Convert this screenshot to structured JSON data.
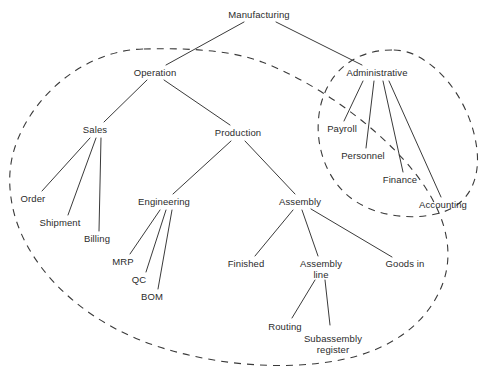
{
  "diagram": {
    "type": "tree-with-dashed-groupings",
    "colors": {
      "text": "#2b2b2b",
      "edge": "#3a3a3a",
      "boundary": "#3a3a3a",
      "background": "#ffffff"
    },
    "nodes": [
      {
        "id": "manufacturing",
        "label": "Manufacturing",
        "x": 259,
        "y": 15
      },
      {
        "id": "operation",
        "label": "Operation",
        "x": 155,
        "y": 73
      },
      {
        "id": "administrative",
        "label": "Administrative",
        "x": 377,
        "y": 73
      },
      {
        "id": "sales",
        "label": "Sales",
        "x": 95,
        "y": 130
      },
      {
        "id": "production",
        "label": "Production",
        "x": 238,
        "y": 133
      },
      {
        "id": "payroll",
        "label": "Payroll",
        "x": 342,
        "y": 129
      },
      {
        "id": "personnel",
        "label": "Personnel",
        "x": 363,
        "y": 156
      },
      {
        "id": "finance",
        "label": "Finance",
        "x": 400,
        "y": 180
      },
      {
        "id": "accounting",
        "label": "Accounting",
        "x": 443,
        "y": 205
      },
      {
        "id": "order",
        "label": "Order",
        "x": 33,
        "y": 199
      },
      {
        "id": "shipment",
        "label": "Shipment",
        "x": 60,
        "y": 223
      },
      {
        "id": "billing",
        "label": "Billing",
        "x": 97,
        "y": 239
      },
      {
        "id": "engineering",
        "label": "Engineering",
        "x": 164,
        "y": 202
      },
      {
        "id": "assembly",
        "label": "Assembly",
        "x": 300,
        "y": 202
      },
      {
        "id": "mrp",
        "label": "MRP",
        "x": 123,
        "y": 262
      },
      {
        "id": "qc",
        "label": "QC",
        "x": 139,
        "y": 280
      },
      {
        "id": "bom",
        "label": "BOM",
        "x": 152,
        "y": 297
      },
      {
        "id": "finished",
        "label": "Finished",
        "x": 246,
        "y": 264
      },
      {
        "id": "assembly_line",
        "label": "Assembly\nline",
        "x": 321,
        "y": 264
      },
      {
        "id": "goods_in",
        "label": "Goods in",
        "x": 405,
        "y": 264
      },
      {
        "id": "routing",
        "label": "Routing",
        "x": 285,
        "y": 327
      },
      {
        "id": "subassembly_register",
        "label": "Subassembly\nregister",
        "x": 333,
        "y": 339
      }
    ],
    "edges": [
      {
        "from": "manufacturing",
        "to": "operation"
      },
      {
        "from": "manufacturing",
        "to": "administrative"
      },
      {
        "from": "operation",
        "to": "sales"
      },
      {
        "from": "operation",
        "to": "production"
      },
      {
        "from": "administrative",
        "to": "payroll"
      },
      {
        "from": "administrative",
        "to": "personnel"
      },
      {
        "from": "administrative",
        "to": "finance"
      },
      {
        "from": "administrative",
        "to": "accounting"
      },
      {
        "from": "sales",
        "to": "order"
      },
      {
        "from": "sales",
        "to": "shipment"
      },
      {
        "from": "sales",
        "to": "billing"
      },
      {
        "from": "production",
        "to": "engineering"
      },
      {
        "from": "production",
        "to": "assembly"
      },
      {
        "from": "engineering",
        "to": "mrp"
      },
      {
        "from": "engineering",
        "to": "qc"
      },
      {
        "from": "engineering",
        "to": "bom"
      },
      {
        "from": "assembly",
        "to": "finished"
      },
      {
        "from": "assembly",
        "to": "assembly_line"
      },
      {
        "from": "assembly",
        "to": "goods_in"
      },
      {
        "from": "assembly_line",
        "to": "routing"
      },
      {
        "from": "assembly_line",
        "to": "subassembly_register"
      }
    ],
    "groupings": [
      {
        "id": "operation-boundary",
        "style": "dashed",
        "encloses": "Operation subtree"
      },
      {
        "id": "administrative-boundary",
        "style": "dashed",
        "encloses": "Administrative subtree"
      }
    ]
  }
}
